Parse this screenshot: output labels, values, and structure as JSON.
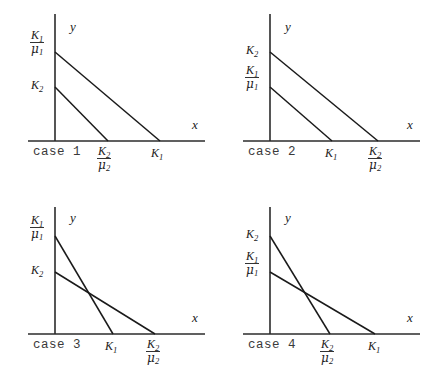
{
  "figure": {
    "background_color": "#ffffff",
    "line_color": "#1a1a1a",
    "axis_color": "#2b2b2b",
    "panel_count": 4
  },
  "axis_labels": {
    "x": "x",
    "y": "y"
  },
  "symbols": {
    "K1": "K",
    "K2": "K",
    "sub1": "1",
    "sub2": "2",
    "mu": "μ"
  },
  "panels": [
    {
      "id": "case-1",
      "case_label": "case 1",
      "y_intercepts": [
        {
          "name": "K1-over-mu1",
          "type": "fraction",
          "num": "K",
          "num_sub": "1",
          "den": "μ",
          "den_sub": "1",
          "position": "upper"
        },
        {
          "name": "K2",
          "type": "plain",
          "base": "K",
          "sub": "2",
          "position": "lower"
        }
      ],
      "x_intercepts": [
        {
          "name": "K2-over-mu2",
          "type": "fraction",
          "num": "K",
          "num_sub": "2",
          "den": "μ",
          "den_sub": "2",
          "position": "inner"
        },
        {
          "name": "K1",
          "type": "plain",
          "base": "K",
          "sub": "1",
          "position": "outer"
        }
      ],
      "lines": [
        {
          "name": "line-1",
          "from": "K1/mu1",
          "to": "K1",
          "crosses": false
        },
        {
          "name": "line-2",
          "from": "K2",
          "to": "K2/mu2",
          "crosses": false
        }
      ],
      "description": "parallel, non-intersecting lines"
    },
    {
      "id": "case-2",
      "case_label": "case 2",
      "y_intercepts": [
        {
          "name": "K2",
          "type": "plain",
          "base": "K",
          "sub": "2",
          "position": "upper"
        },
        {
          "name": "K1-over-mu1",
          "type": "fraction",
          "num": "K",
          "num_sub": "1",
          "den": "μ",
          "den_sub": "1",
          "position": "lower"
        }
      ],
      "x_intercepts": [
        {
          "name": "K1",
          "type": "plain",
          "base": "K",
          "sub": "1",
          "position": "inner"
        },
        {
          "name": "K2-over-mu2",
          "type": "fraction",
          "num": "K",
          "num_sub": "2",
          "den": "μ",
          "den_sub": "2",
          "position": "outer"
        }
      ],
      "lines": [
        {
          "name": "line-1",
          "from": "K2",
          "to": "K2/mu2",
          "crosses": false
        },
        {
          "name": "line-2",
          "from": "K1/mu1",
          "to": "K1",
          "crosses": false
        }
      ],
      "description": "parallel, non-intersecting lines"
    },
    {
      "id": "case-3",
      "case_label": "case 3",
      "y_intercepts": [
        {
          "name": "K1-over-mu1",
          "type": "fraction",
          "num": "K",
          "num_sub": "1",
          "den": "μ",
          "den_sub": "1",
          "position": "upper"
        },
        {
          "name": "K2",
          "type": "plain",
          "base": "K",
          "sub": "2",
          "position": "lower"
        }
      ],
      "x_intercepts": [
        {
          "name": "K1",
          "type": "plain",
          "base": "K",
          "sub": "1",
          "position": "inner"
        },
        {
          "name": "K2-over-mu2",
          "type": "fraction",
          "num": "K",
          "num_sub": "2",
          "den": "μ",
          "den_sub": "2",
          "position": "outer"
        }
      ],
      "lines": [
        {
          "name": "line-1",
          "from": "K1/mu1",
          "to": "K1",
          "crosses": true
        },
        {
          "name": "line-2",
          "from": "K2",
          "to": "K2/mu2",
          "crosses": true
        }
      ],
      "description": "intersecting lines"
    },
    {
      "id": "case-4",
      "case_label": "case 4",
      "y_intercepts": [
        {
          "name": "K2",
          "type": "plain",
          "base": "K",
          "sub": "2",
          "position": "upper"
        },
        {
          "name": "K1-over-mu1",
          "type": "fraction",
          "num": "K",
          "num_sub": "1",
          "den": "μ",
          "den_sub": "1",
          "position": "lower"
        }
      ],
      "x_intercepts": [
        {
          "name": "K2-over-mu2",
          "type": "fraction",
          "num": "K",
          "num_sub": "2",
          "den": "μ",
          "den_sub": "2",
          "position": "inner"
        },
        {
          "name": "K1",
          "type": "plain",
          "base": "K",
          "sub": "1",
          "position": "outer"
        }
      ],
      "lines": [
        {
          "name": "line-1",
          "from": "K2",
          "to": "K2/mu2",
          "crosses": true
        },
        {
          "name": "line-2",
          "from": "K1/mu1",
          "to": "K1",
          "crosses": true
        }
      ],
      "description": "intersecting lines"
    }
  ]
}
